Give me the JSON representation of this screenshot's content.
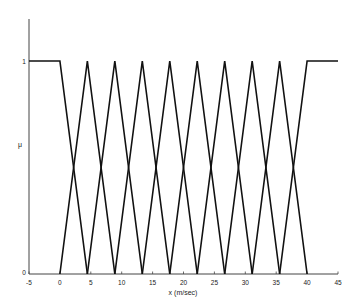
{
  "chart_data": {
    "type": "line",
    "title": "",
    "xlabel": "x (m/sec)",
    "ylabel": "μ",
    "xlim": [
      -5,
      45
    ],
    "ylim": [
      0,
      1.2
    ],
    "grid": false,
    "legend": null,
    "x_ticks": [
      -5,
      0,
      5,
      10,
      15,
      20,
      25,
      30,
      35,
      40,
      45
    ],
    "x_tick_labels": [
      "-5",
      "0",
      "5",
      "10",
      "15",
      "20",
      "25",
      "30",
      "35",
      "40",
      "45"
    ],
    "y_ticks": [
      0,
      1
    ],
    "y_tick_labels": [
      "0",
      "1"
    ],
    "series": [
      {
        "name": "MF1 (left shoulder)",
        "x": [
          -5,
          0,
          4.444
        ],
        "y": [
          1,
          1,
          0
        ]
      },
      {
        "name": "MF2",
        "x": [
          0,
          4.444,
          8.889
        ],
        "y": [
          0,
          1,
          0
        ]
      },
      {
        "name": "MF3",
        "x": [
          4.444,
          8.889,
          13.333
        ],
        "y": [
          0,
          1,
          0
        ]
      },
      {
        "name": "MF4",
        "x": [
          8.889,
          13.333,
          17.778
        ],
        "y": [
          0,
          1,
          0
        ]
      },
      {
        "name": "MF5",
        "x": [
          13.333,
          17.778,
          22.222
        ],
        "y": [
          0,
          1,
          0
        ]
      },
      {
        "name": "MF6",
        "x": [
          17.778,
          22.222,
          26.667
        ],
        "y": [
          0,
          1,
          0
        ]
      },
      {
        "name": "MF7",
        "x": [
          22.222,
          26.667,
          31.111
        ],
        "y": [
          0,
          1,
          0
        ]
      },
      {
        "name": "MF8",
        "x": [
          26.667,
          31.111,
          35.556
        ],
        "y": [
          0,
          1,
          0
        ]
      },
      {
        "name": "MF9",
        "x": [
          31.111,
          35.556,
          40
        ],
        "y": [
          0,
          1,
          0
        ]
      },
      {
        "name": "MF10 (right shoulder)",
        "x": [
          35.556,
          40,
          45
        ],
        "y": [
          0,
          1,
          1
        ]
      }
    ],
    "line_color": "#111111"
  },
  "labels": {
    "xlabel": "x (m/sec)",
    "ylabel": "μ",
    "y_one": "1",
    "y_zero": "0"
  }
}
